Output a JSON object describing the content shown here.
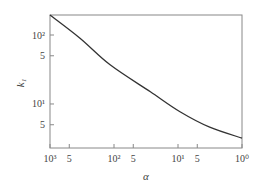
{
  "chart_data": {
    "type": "line",
    "title": "",
    "xlabel": "α",
    "ylabel": "k₁",
    "xscale": "log",
    "yscale": "log",
    "x_reversed": true,
    "xlim": [
      1000,
      1
    ],
    "ylim": [
      2.3,
      195
    ],
    "grid": false,
    "legend": null,
    "x_ticks": [
      {
        "value": 1000,
        "label": "10³"
      },
      {
        "value": 500,
        "label": "5"
      },
      {
        "value": 100,
        "label": "10²"
      },
      {
        "value": 50,
        "label": "5"
      },
      {
        "value": 10,
        "label": "10¹"
      },
      {
        "value": 5,
        "label": "5"
      },
      {
        "value": 1,
        "label": "10⁰"
      }
    ],
    "y_ticks": [
      {
        "value": 100,
        "label": "10²"
      },
      {
        "value": 50,
        "label": "5"
      },
      {
        "value": 10,
        "label": "10¹"
      },
      {
        "value": 5,
        "label": "5"
      }
    ],
    "series": [
      {
        "name": "k1",
        "color": "#333333",
        "x": [
          1000,
          340,
          115,
          27,
          9.3,
          3.2,
          1
        ],
        "y": [
          195,
          90,
          37,
          15,
          7.7,
          4.6,
          3.2
        ]
      }
    ]
  },
  "colors": {
    "axis": "#888888",
    "curve": "#333333"
  }
}
